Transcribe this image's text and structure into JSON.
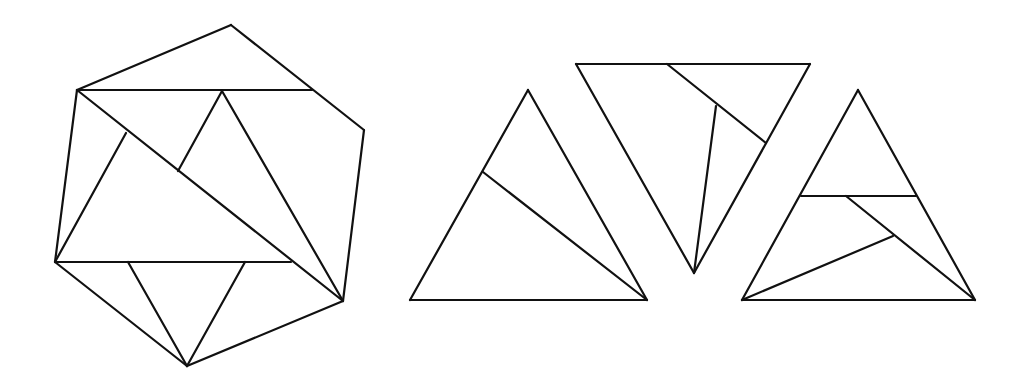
{
  "diagram": {
    "type": "geometric-dissection",
    "stroke_color": "#111111",
    "background": "#ffffff",
    "figures": [
      {
        "id": "hexagon-dissection",
        "segments": [
          [
            231,
            25,
            77,
            90
          ],
          [
            231,
            25,
            364,
            130
          ],
          [
            77,
            90,
            312,
            90
          ],
          [
            364,
            130,
            343,
            301
          ],
          [
            77,
            90,
            55,
            262
          ],
          [
            55,
            262,
            187,
            366
          ],
          [
            187,
            366,
            343,
            301
          ],
          [
            77,
            90,
            343,
            301
          ],
          [
            55,
            262,
            291,
            262
          ],
          [
            55,
            262,
            126,
            133
          ],
          [
            222,
            91,
            178,
            171
          ],
          [
            222,
            91,
            343,
            301
          ],
          [
            128,
            262,
            187,
            366
          ],
          [
            245,
            262,
            187,
            366
          ]
        ]
      },
      {
        "id": "triangle-left",
        "segments": [
          [
            528,
            90,
            410,
            300
          ],
          [
            528,
            90,
            647,
            300
          ],
          [
            410,
            300,
            647,
            300
          ],
          [
            483,
            172,
            647,
            300
          ]
        ]
      },
      {
        "id": "triangle-inverted",
        "segments": [
          [
            576,
            64,
            810,
            64
          ],
          [
            576,
            64,
            694,
            273
          ],
          [
            810,
            64,
            694,
            273
          ],
          [
            667,
            64,
            766,
            143
          ],
          [
            716,
            106,
            694,
            273
          ]
        ]
      },
      {
        "id": "triangle-right",
        "segments": [
          [
            858,
            90,
            742,
            300
          ],
          [
            858,
            90,
            975,
            300
          ],
          [
            742,
            300,
            975,
            300
          ],
          [
            801,
            196,
            916,
            196
          ],
          [
            846,
            196,
            975,
            300
          ],
          [
            742,
            300,
            893,
            236
          ]
        ]
      }
    ]
  }
}
